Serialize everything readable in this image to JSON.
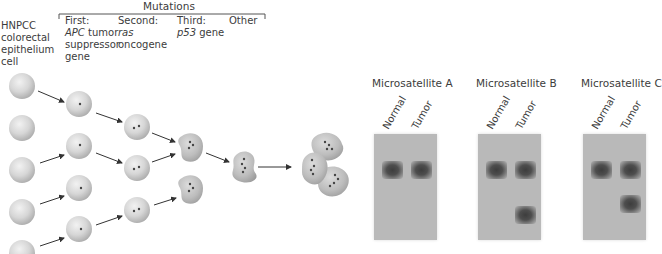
{
  "header": {
    "cell_label": [
      "HNPCC",
      "colorectal",
      "epithelium",
      "cell"
    ],
    "mutations_title": "Mutations",
    "mutation_columns": [
      {
        "ordinal": "First:",
        "gene_italic": "APC",
        "gene_rest": " tumor",
        "lines": [
          "suppressor",
          "gene"
        ]
      },
      {
        "ordinal": "Second:",
        "gene_italic": "ras",
        "gene_rest": "",
        "lines": [
          "oncogene"
        ]
      },
      {
        "ordinal": "Third:",
        "gene_italic": "p53",
        "gene_rest": " gene",
        "lines": []
      },
      {
        "ordinal": "Other",
        "gene_italic": "",
        "gene_rest": "",
        "lines": []
      }
    ]
  },
  "progression": {
    "stages": [
      {
        "name": "normal-cells",
        "count": 5,
        "dots": 0
      },
      {
        "name": "first-mutation",
        "count": 4,
        "dots": 1
      },
      {
        "name": "second-mutation",
        "count": 3,
        "dots": 2
      },
      {
        "name": "third-mutation",
        "count": 2,
        "dots": 3
      },
      {
        "name": "other-mutation",
        "count": 1,
        "dots": 4
      },
      {
        "name": "tumor-cluster",
        "count": 3,
        "dots": 4
      }
    ]
  },
  "gels": [
    {
      "title": "Microsatellite A",
      "lanes": [
        "Normal",
        "Tumor"
      ],
      "tumor_extra_band": false
    },
    {
      "title": "Microsatellite B",
      "lanes": [
        "Normal",
        "Tumor"
      ],
      "tumor_extra_band": true,
      "extra_band_position": "low"
    },
    {
      "title": "Microsatellite C",
      "lanes": [
        "Normal",
        "Tumor"
      ],
      "tumor_extra_band": true,
      "extra_band_position": "mid"
    }
  ],
  "colors": {
    "cell_fill": "#d8d8d8",
    "gel_background": "#b9b9b9",
    "band": "#3d3d3d",
    "arrow": "#333333",
    "text": "#3c3c3c"
  }
}
